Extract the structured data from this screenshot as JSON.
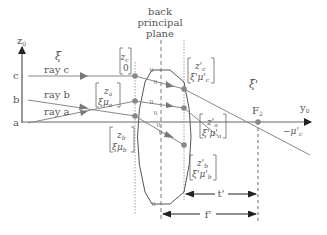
{
  "diagram": {
    "title": "back principal plane",
    "title_lines": [
      "back",
      "principal",
      "plane"
    ],
    "axes": {
      "vertical": {
        "label": "z",
        "sub": "0"
      },
      "horizontal": {
        "label": "y",
        "sub": "0"
      }
    },
    "spaces": {
      "object": "ξ",
      "image": "ξ'"
    },
    "rays": [
      {
        "id": "a",
        "point_label": "a",
        "label": "ray a"
      },
      {
        "id": "b",
        "point_label": "b",
        "label": "ray b"
      },
      {
        "id": "c",
        "point_label": "c",
        "label": "ray c"
      }
    ],
    "input_vectors": {
      "c": {
        "top": "z_c",
        "top_main": "z",
        "top_sub": "c",
        "bottom": "0"
      },
      "a": {
        "top_main": "z",
        "top_sub": "a",
        "bottom_main": "ξμ",
        "bottom_sub": "a"
      },
      "b": {
        "top_main": "z",
        "top_sub": "b",
        "bottom_main": "ξμ",
        "bottom_sub": "b"
      }
    },
    "output_vectors": {
      "c": {
        "top_main": "z'",
        "top_sub": "c",
        "bottom_main": "ξ'μ'",
        "bottom_sub": "c"
      },
      "a": {
        "top_main": "z'",
        "top_sub": "a",
        "bottom_main": "ξ'μ'",
        "bottom_sub": "a"
      },
      "b": {
        "top_main": "z'",
        "top_sub": "b",
        "bottom_main": "ξ'μ'",
        "bottom_sub": "b"
      }
    },
    "focal_point": {
      "label": "F",
      "sub": "2"
    },
    "angle_label": "−μ'c",
    "angle_main": "−μ'",
    "angle_sub": "c",
    "dimensions": {
      "t": "t'",
      "f": "f'"
    },
    "colors": {
      "line": "#7a7a7a",
      "dark": "#333333",
      "point": "#808080"
    }
  }
}
